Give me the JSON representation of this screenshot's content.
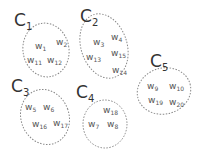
{
  "clusters": [
    {
      "id": "C1",
      "label_main": "C",
      "label_sub": "1",
      "members": [
        {
          "main": "w",
          "sub": "1"
        },
        {
          "main": "w",
          "sub": "2"
        },
        {
          "main": "w",
          "sub": "11"
        },
        {
          "main": "w",
          "sub": "12"
        }
      ]
    },
    {
      "id": "C2",
      "label_main": "C",
      "label_sub": "2",
      "members": [
        {
          "main": "w",
          "sub": "3"
        },
        {
          "main": "w",
          "sub": "4"
        },
        {
          "main": "w",
          "sub": "13"
        },
        {
          "main": "w",
          "sub": "15"
        },
        {
          "main": "w",
          "sub": "14"
        }
      ]
    },
    {
      "id": "C3",
      "label_main": "C",
      "label_sub": "3",
      "members": [
        {
          "main": "w",
          "sub": "5"
        },
        {
          "main": "w",
          "sub": "6"
        },
        {
          "main": "w",
          "sub": "16"
        },
        {
          "main": "w",
          "sub": "17"
        }
      ]
    },
    {
      "id": "C4",
      "label_main": "C",
      "label_sub": "4",
      "members": [
        {
          "main": "w",
          "sub": "18"
        },
        {
          "main": "w",
          "sub": "7"
        },
        {
          "main": "w",
          "sub": "8"
        }
      ]
    },
    {
      "id": "C5",
      "label_main": "C",
      "label_sub": "5",
      "members": [
        {
          "main": "w",
          "sub": "9"
        },
        {
          "main": "w",
          "sub": "10"
        },
        {
          "main": "w",
          "sub": "19"
        },
        {
          "main": "w",
          "sub": "20"
        }
      ]
    }
  ],
  "style": {
    "ellipse_stroke": "#777777",
    "text_color": "#555555",
    "label_color": "#333333"
  }
}
